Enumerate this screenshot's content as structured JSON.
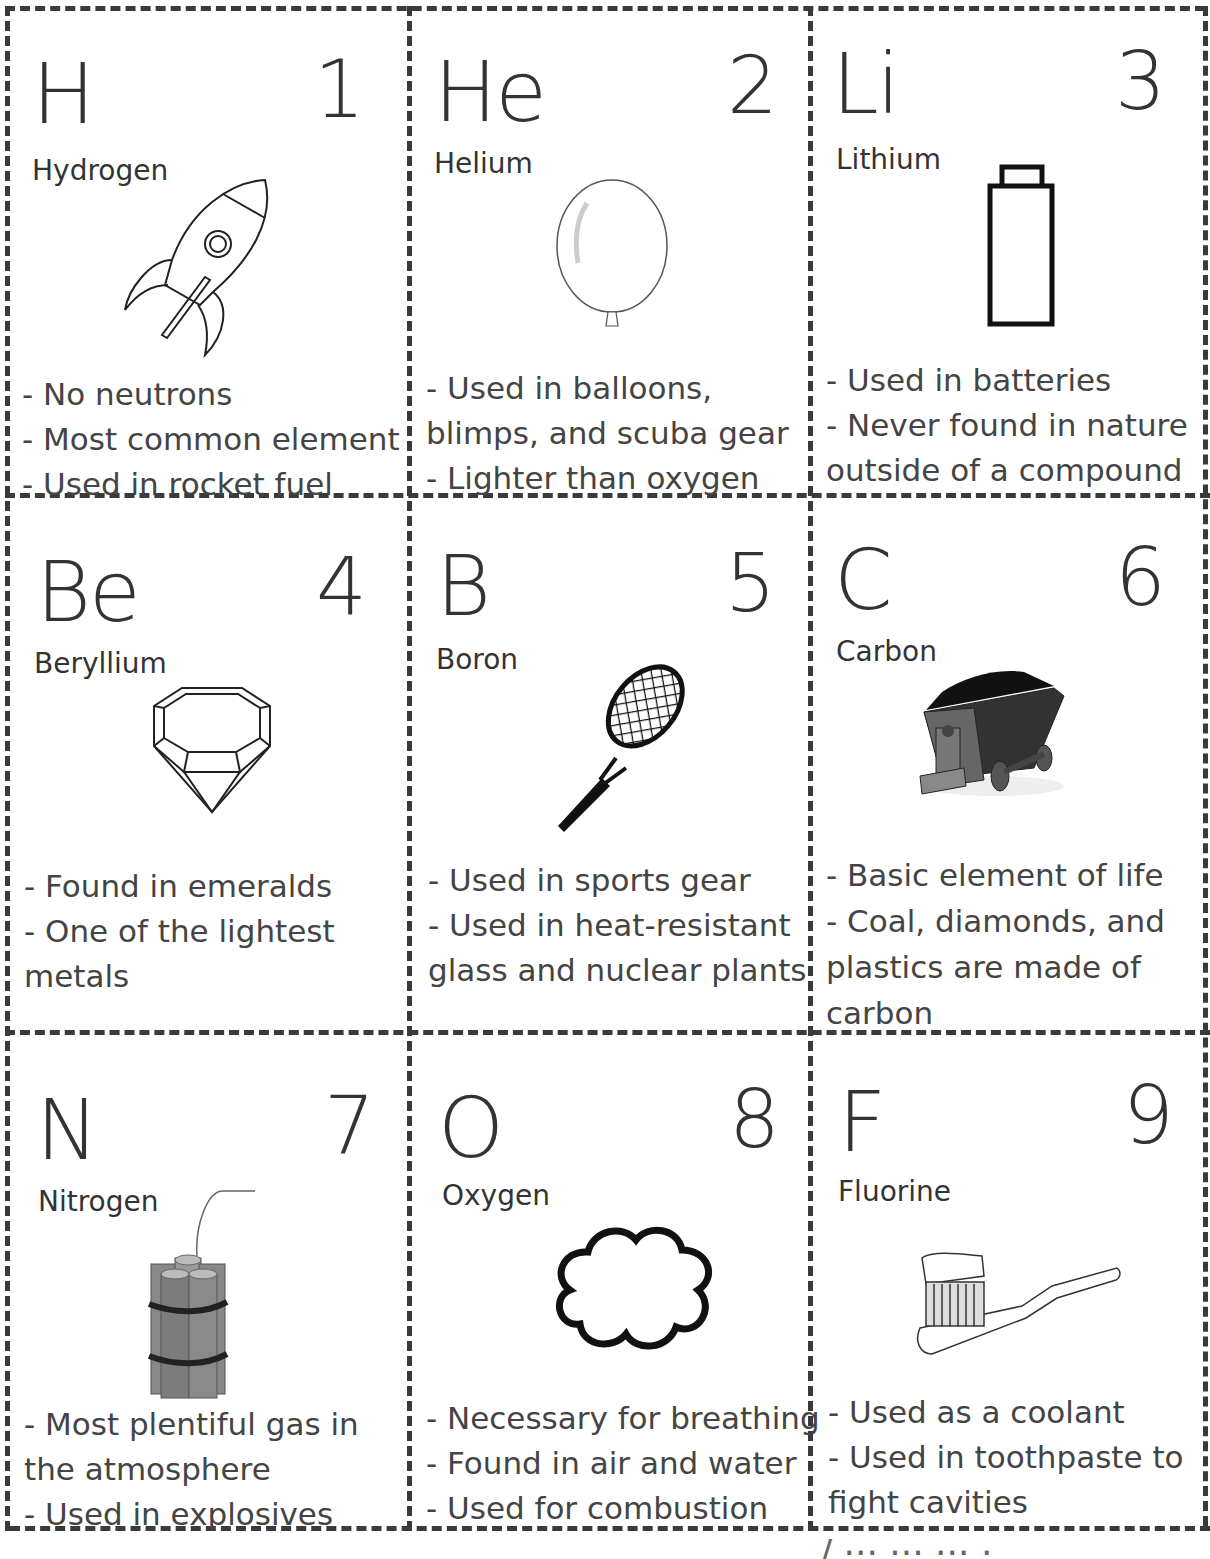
{
  "cards": [
    {
      "symbol": "H",
      "number": "1",
      "name": "Hydrogen",
      "icon": "rocket-icon",
      "facts": [
        "- No neutrons",
        "- Most common element",
        "- Used in rocket fuel"
      ]
    },
    {
      "symbol": "He",
      "number": "2",
      "name": "Helium",
      "icon": "balloon-icon",
      "facts": [
        "- Used in balloons,",
        "blimps, and scuba gear",
        "- Lighter than oxygen"
      ]
    },
    {
      "symbol": "Li",
      "number": "3",
      "name": "Lithium",
      "icon": "battery-icon",
      "facts": [
        "- Used in batteries",
        "- Never found in nature",
        "outside of a compound"
      ]
    },
    {
      "symbol": "Be",
      "number": "4",
      "name": "Beryllium",
      "icon": "gem-icon",
      "facts": [
        "- Found in emeralds",
        "- One of the lightest",
        "metals"
      ]
    },
    {
      "symbol": "B",
      "number": "5",
      "name": "Boron",
      "icon": "tennis-racket-icon",
      "facts": [
        "- Used in sports gear",
        "- Used in heat-resistant",
        "glass and nuclear plants"
      ]
    },
    {
      "symbol": "C",
      "number": "6",
      "name": "Carbon",
      "icon": "coal-cart-icon",
      "facts": [
        "- Basic element of life",
        "- Coal, diamonds, and",
        "plastics are made of",
        "carbon"
      ]
    },
    {
      "symbol": "N",
      "number": "7",
      "name": "Nitrogen",
      "icon": "dynamite-icon",
      "facts": [
        "- Most plentiful gas in",
        "the atmosphere",
        "- Used in explosives"
      ]
    },
    {
      "symbol": "O",
      "number": "8",
      "name": "Oxygen",
      "icon": "cloud-icon",
      "facts": [
        "- Necessary for breathing",
        "- Found in air and water",
        "- Used for combustion"
      ]
    },
    {
      "symbol": "F",
      "number": "9",
      "name": "Fluorine",
      "icon": "toothbrush-icon",
      "facts": [
        "- Used as a coolant",
        "- Used in toothpaste to",
        "fight cavities"
      ]
    }
  ],
  "footer": {
    "cut_text": "/ ··· ··· ···  ·"
  }
}
